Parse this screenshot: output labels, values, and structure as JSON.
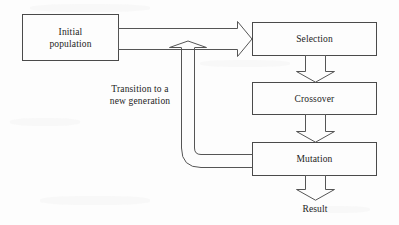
{
  "diagram": {
    "type": "flowchart",
    "background_color": "#fdfdfd",
    "line_color": "#555555",
    "text_color": "#1c1c1c",
    "nodes": [
      {
        "id": "initial-population",
        "label": "Initial\npopulation",
        "shape": "rectangle"
      },
      {
        "id": "selection",
        "label": "Selection",
        "shape": "rectangle"
      },
      {
        "id": "crossover",
        "label": "Crossover",
        "shape": "rectangle"
      },
      {
        "id": "mutation",
        "label": "Mutation",
        "shape": "rectangle"
      },
      {
        "id": "result",
        "label": "Result",
        "shape": "text"
      }
    ],
    "edges": [
      {
        "id": "initial-to-selection",
        "from": "initial-population",
        "to": "selection",
        "style": "block-arrow",
        "direction": "right",
        "label": ""
      },
      {
        "id": "selection-to-crossover",
        "from": "selection",
        "to": "crossover",
        "style": "block-arrow",
        "direction": "down",
        "label": ""
      },
      {
        "id": "crossover-to-mutation",
        "from": "crossover",
        "to": "mutation",
        "style": "block-arrow",
        "direction": "down",
        "label": ""
      },
      {
        "id": "mutation-to-result",
        "from": "mutation",
        "to": "result",
        "style": "block-arrow",
        "direction": "down",
        "label": ""
      },
      {
        "id": "mutation-to-selection-feedback",
        "from": "mutation",
        "to": "selection",
        "style": "block-arrow-curved",
        "direction": "up",
        "label": "Transition to a\nnew generation"
      }
    ],
    "annotations": [
      {
        "id": "transition-label",
        "text": "Transition to a\nnew generation"
      }
    ]
  }
}
